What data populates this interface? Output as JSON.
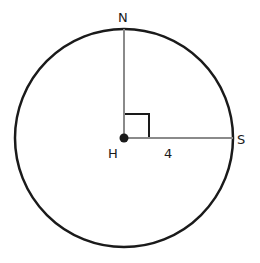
{
  "diagram": {
    "type": "circle-geometry",
    "circle": {
      "cx": 124,
      "cy": 138,
      "r": 109,
      "stroke": "#1a1a1a",
      "stroke_width": 2.5
    },
    "center_point": {
      "label": "H",
      "x": 124,
      "y": 138
    },
    "points": [
      {
        "label": "N",
        "x": 124,
        "y": 29
      },
      {
        "label": "S",
        "x": 233,
        "y": 138
      }
    ],
    "segments": [
      {
        "from": "H",
        "to": "N",
        "color": "#8a8a8a"
      },
      {
        "from": "H",
        "to": "S",
        "color": "#8a8a8a",
        "length_label": "4"
      }
    ],
    "right_angle_at": "H",
    "labels": {
      "N": "N",
      "H": "H",
      "S": "S",
      "HS_length": "4"
    }
  }
}
